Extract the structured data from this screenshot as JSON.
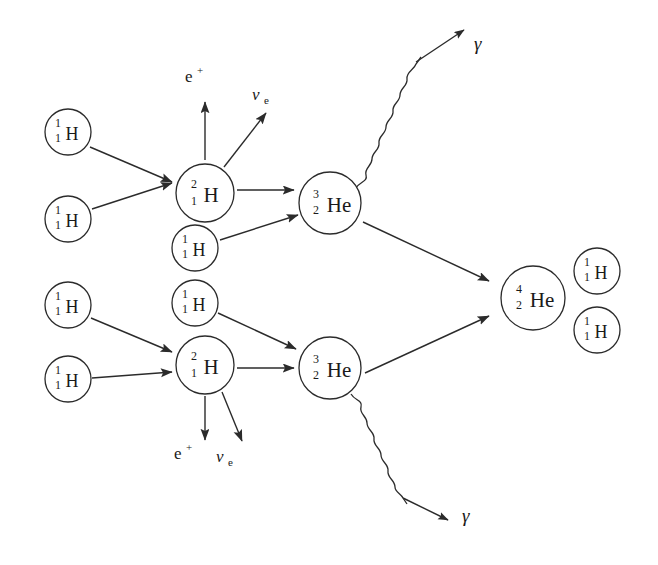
{
  "diagram": {
    "background_color": "#ffffff",
    "stroke_color": "#2b2b2b",
    "nuclei": [
      {
        "id": "h1-a",
        "element": "H",
        "mass_number": "1",
        "atomic_number": "1",
        "cx": 68,
        "cy": 132,
        "r": 23,
        "size": "small"
      },
      {
        "id": "h1-b",
        "element": "H",
        "mass_number": "1",
        "atomic_number": "1",
        "cx": 68,
        "cy": 219,
        "r": 23,
        "size": "small"
      },
      {
        "id": "h2-top",
        "element": "H",
        "mass_number": "2",
        "atomic_number": "1",
        "cx": 205,
        "cy": 193,
        "r": 29,
        "size": "large"
      },
      {
        "id": "h1-c",
        "element": "H",
        "mass_number": "1",
        "atomic_number": "1",
        "cx": 195,
        "cy": 248,
        "r": 23,
        "size": "small"
      },
      {
        "id": "he3-top",
        "element": "He",
        "mass_number": "3",
        "atomic_number": "2",
        "cx": 330,
        "cy": 203,
        "r": 31,
        "size": "large"
      },
      {
        "id": "h1-d",
        "element": "H",
        "mass_number": "1",
        "atomic_number": "1",
        "cx": 68,
        "cy": 305,
        "r": 23,
        "size": "small"
      },
      {
        "id": "h1-e",
        "element": "H",
        "mass_number": "1",
        "atomic_number": "1",
        "cx": 68,
        "cy": 379,
        "r": 23,
        "size": "small"
      },
      {
        "id": "h1-f",
        "element": "H",
        "mass_number": "1",
        "atomic_number": "1",
        "cx": 195,
        "cy": 303,
        "r": 23,
        "size": "small"
      },
      {
        "id": "h2-bot",
        "element": "H",
        "mass_number": "2",
        "atomic_number": "1",
        "cx": 205,
        "cy": 365,
        "r": 29,
        "size": "large"
      },
      {
        "id": "he3-bot",
        "element": "He",
        "mass_number": "3",
        "atomic_number": "2",
        "cx": 330,
        "cy": 368,
        "r": 31,
        "size": "large"
      },
      {
        "id": "he4",
        "element": "He",
        "mass_number": "4",
        "atomic_number": "2",
        "cx": 533,
        "cy": 298,
        "r": 32,
        "size": "large"
      },
      {
        "id": "h1-out1",
        "element": "H",
        "mass_number": "1",
        "atomic_number": "1",
        "cx": 597,
        "cy": 271,
        "r": 23,
        "size": "small"
      },
      {
        "id": "h1-out2",
        "element": "H",
        "mass_number": "1",
        "atomic_number": "1",
        "cx": 597,
        "cy": 330,
        "r": 23,
        "size": "small"
      }
    ],
    "particles": [
      {
        "id": "positron-top",
        "symbol": "e",
        "superscript": "+",
        "subscript": "",
        "x": 185,
        "y": 82,
        "kind": "positron"
      },
      {
        "id": "neutrino-top",
        "symbol": "ν",
        "superscript": "",
        "subscript": "e",
        "x": 252,
        "y": 100,
        "kind": "neutrino"
      },
      {
        "id": "positron-bot",
        "symbol": "e",
        "superscript": "+",
        "subscript": "",
        "x": 174,
        "y": 459,
        "kind": "positron"
      },
      {
        "id": "neutrino-bot",
        "symbol": "ν",
        "superscript": "",
        "subscript": "e",
        "x": 216,
        "y": 462,
        "kind": "neutrino"
      },
      {
        "id": "gamma-top",
        "symbol": "γ",
        "superscript": "",
        "subscript": "",
        "x": 474,
        "y": 50,
        "kind": "gamma"
      },
      {
        "id": "gamma-bot",
        "symbol": "γ",
        "superscript": "",
        "subscript": "",
        "x": 462,
        "y": 522,
        "kind": "gamma"
      }
    ],
    "reaction_steps": [
      "1H + 1H → 2H + e+ + νe",
      "2H + 1H → 3He + γ",
      "3He + 3He → 4He + 1H + 1H"
    ]
  }
}
